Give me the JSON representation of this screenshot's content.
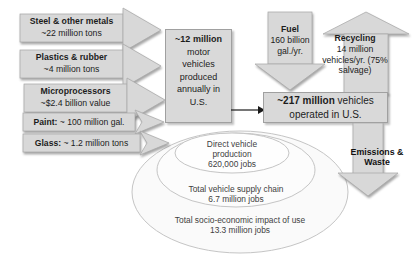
{
  "colors": {
    "shape_fill": "#d8d8d8",
    "box_fill": "#d9d9d9",
    "shape_stroke": "#a8a8a8",
    "text": "#1c1c1c",
    "ellipse_stroke": "#c5c5c5",
    "background": "#ffffff"
  },
  "inputs": [
    {
      "title": "Steel & other metals",
      "value": "~22 million tons"
    },
    {
      "title": "Plastics & rubber",
      "value": "~4 million tons"
    },
    {
      "title": "Microprocessors",
      "value": "~$2.4 billion value"
    },
    {
      "title": "Paint:",
      "value": "~ 100 million gal."
    },
    {
      "title": "Glass:",
      "value": "~ 1.2 million tons"
    }
  ],
  "production_box": {
    "highlight": "~12 million",
    "rest": "motor vehicles produced annually in U.S."
  },
  "fuel_arrow": {
    "title": "Fuel",
    "value": "160 billion gal./yr."
  },
  "recycling_arrow": {
    "title": "Recycling",
    "value": "14 million vehicles/yr. (75% salvage)"
  },
  "operated_box": {
    "highlight": "~217 million",
    "rest": "vehicles operated in U.S."
  },
  "emissions_arrow": {
    "label": "Emissions & Waste"
  },
  "jobs_ellipses": [
    {
      "label": "Direct vehicle production",
      "jobs": "620,000 jobs"
    },
    {
      "label": "Total vehicle supply chain",
      "jobs": "6.7 million jobs"
    },
    {
      "label": "Total socio-economic impact of use",
      "jobs": "13.3 million jobs"
    }
  ]
}
